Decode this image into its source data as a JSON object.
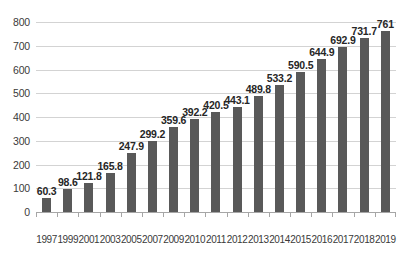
{
  "chart_data": {
    "type": "bar",
    "title": "",
    "subtitle": "",
    "xlabel": "",
    "ylabel": "",
    "categories": [
      "1997",
      "1999",
      "2001",
      "2003",
      "2005",
      "2007",
      "2009",
      "2010",
      "2011",
      "2012",
      "2013",
      "2014",
      "2015",
      "2016",
      "2017",
      "2018",
      "2019"
    ],
    "values": [
      60.3,
      98.6,
      121.8,
      165.8,
      247.9,
      299.2,
      359.6,
      392.2,
      420.5,
      443.1,
      489.8,
      533.2,
      590.5,
      644.9,
      692.9,
      731.7,
      761
    ],
    "data_labels": [
      "60.3",
      "98.6",
      "121.8",
      "165.8",
      "247.9",
      "299.2",
      "359.6",
      "392.2",
      "420.5",
      "443.1",
      "489.8",
      "533.2",
      "590.5",
      "644.9",
      "692.9",
      "731.7",
      "761"
    ],
    "ylim": [
      0,
      800
    ],
    "ytick_values": [
      0,
      100,
      200,
      300,
      400,
      500,
      600,
      700,
      800
    ],
    "ytick_labels": [
      "0",
      "100",
      "200",
      "300",
      "400",
      "500",
      "600",
      "700",
      "800"
    ],
    "grid": true,
    "legend": null,
    "legend_position": "none",
    "series": [
      {
        "name": "",
        "values": [
          60.3,
          98.6,
          121.8,
          165.8,
          247.9,
          299.2,
          359.6,
          392.2,
          420.5,
          443.1,
          489.8,
          533.2,
          590.5,
          644.9,
          692.9,
          731.7,
          761
        ]
      }
    ]
  },
  "colors": {
    "bar_fill": "#595959",
    "gridline": "#d3d3d3",
    "axis": "#a6a6a6",
    "tick_text": "#3a3a3a",
    "label_text": "#262626",
    "background": "#ffffff"
  }
}
